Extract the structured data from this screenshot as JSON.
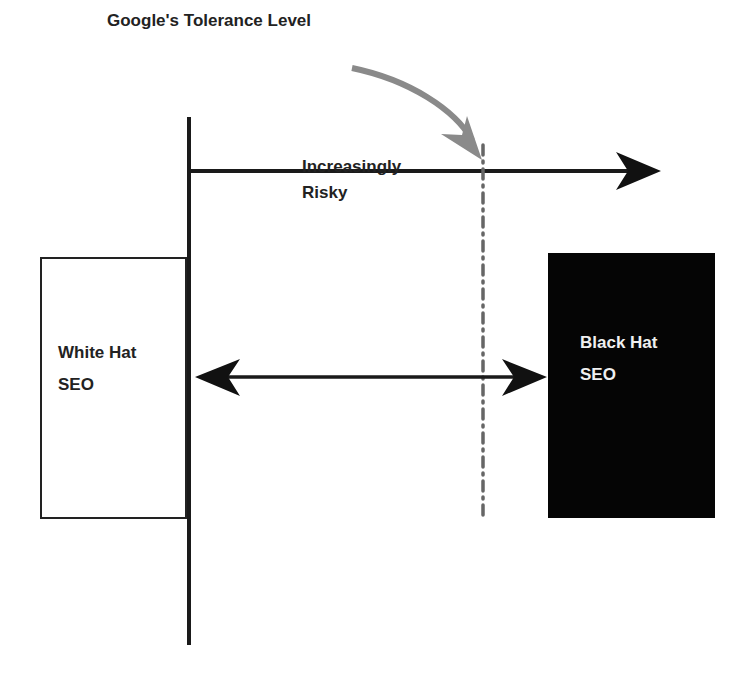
{
  "diagram": {
    "title": "Google's Tolerance Level",
    "risk_axis_label": [
      "Increasingly",
      "Risky"
    ],
    "left_box": {
      "line1": "White Hat",
      "line2": "SEO",
      "fill": "#ffffff"
    },
    "right_box": {
      "line1": "Black Hat",
      "line2": "SEO",
      "fill": "#050505"
    },
    "tolerance_line_style": "dash-dot",
    "pointer_arrow_color": "#8a8a8a",
    "line_color": "#1a1a1a"
  }
}
